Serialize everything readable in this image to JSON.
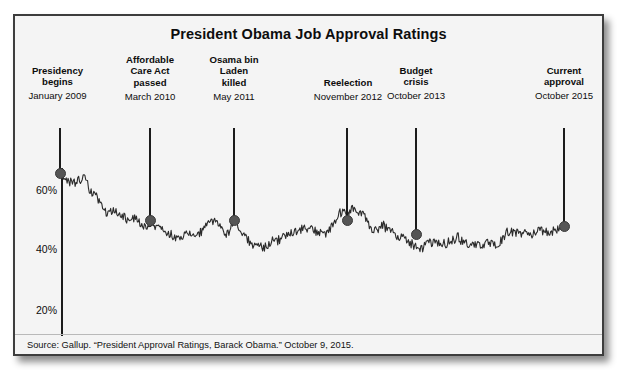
{
  "chart": {
    "title": "President Obama Job Approval Ratings",
    "source": "Source: Gallup. “President Approval Ratings, Barack Obama.” October 9, 2015.",
    "y_ticks": [
      {
        "label": "60%",
        "value": 60
      },
      {
        "label": "40%",
        "value": 40
      },
      {
        "label": "20%",
        "value": 20
      }
    ],
    "annotations": [
      {
        "label": "Presidency\nbegins",
        "date": "January 2009",
        "value": 67
      },
      {
        "label": "Affordable\nCare Act\npassed",
        "date": "March 2010",
        "value": 47
      },
      {
        "label": "Osama bin\nLaden\nkilled",
        "date": "May 2011",
        "value": 47
      },
      {
        "label": "Reelection",
        "date": "November 2012",
        "value": 52
      },
      {
        "label": "Budget\ncrisis",
        "date": "October 2013",
        "value": 41
      },
      {
        "label": "Current\napproval",
        "date": "October 2015",
        "value": 48
      }
    ],
    "colors": {
      "line": "#2b2b2b",
      "marker": "#555555",
      "frame": "#3d3d3d",
      "background": "#f4f4f4"
    }
  },
  "chart_data": {
    "type": "line",
    "title": "President Obama Job Approval Ratings",
    "xlabel": "",
    "ylabel": "Approval (%)",
    "ylim": [
      15,
      72
    ],
    "xlim": [
      "January 2009",
      "October 2015"
    ],
    "grid": false,
    "legend": null,
    "series": [
      {
        "name": "Job approval rating",
        "x": [
          "2009-01",
          "2009-02",
          "2009-03",
          "2009-04",
          "2009-05",
          "2009-06",
          "2009-07",
          "2009-08",
          "2009-09",
          "2009-10",
          "2009-11",
          "2009-12",
          "2010-01",
          "2010-02",
          "2010-03",
          "2010-04",
          "2010-05",
          "2010-06",
          "2010-07",
          "2010-08",
          "2010-09",
          "2010-10",
          "2010-11",
          "2010-12",
          "2011-01",
          "2011-02",
          "2011-03",
          "2011-04",
          "2011-05",
          "2011-06",
          "2011-07",
          "2011-08",
          "2011-09",
          "2011-10",
          "2011-11",
          "2011-12",
          "2012-01",
          "2012-02",
          "2012-03",
          "2012-04",
          "2012-05",
          "2012-06",
          "2012-07",
          "2012-08",
          "2012-09",
          "2012-10",
          "2012-11",
          "2012-12",
          "2013-01",
          "2013-02",
          "2013-03",
          "2013-04",
          "2013-05",
          "2013-06",
          "2013-07",
          "2013-08",
          "2013-09",
          "2013-10",
          "2013-11",
          "2013-12",
          "2014-01",
          "2014-02",
          "2014-03",
          "2014-04",
          "2014-05",
          "2014-06",
          "2014-07",
          "2014-08",
          "2014-09",
          "2014-10",
          "2014-11",
          "2014-12",
          "2015-01",
          "2015-02",
          "2015-03",
          "2015-04",
          "2015-05",
          "2015-06",
          "2015-07",
          "2015-08",
          "2015-09",
          "2015-10"
        ],
        "values": [
          67,
          63,
          62,
          63,
          64,
          59,
          57,
          53,
          52,
          53,
          51,
          50,
          50,
          49,
          47,
          48,
          47,
          46,
          45,
          44,
          45,
          45,
          45,
          46,
          49,
          50,
          47,
          45,
          51,
          46,
          44,
          41,
          41,
          41,
          43,
          43,
          44,
          46,
          46,
          47,
          47,
          46,
          46,
          45,
          49,
          52,
          52,
          54,
          52,
          51,
          47,
          47,
          48,
          46,
          45,
          44,
          43,
          41,
          40,
          42,
          42,
          42,
          42,
          43,
          44,
          42,
          42,
          41,
          42,
          42,
          41,
          43,
          46,
          46,
          45,
          46,
          45,
          46,
          46,
          46,
          47,
          48
        ]
      }
    ],
    "annotations": [
      {
        "x": "2009-01",
        "y": 67,
        "label": "Presidency begins",
        "date": "January 2009"
      },
      {
        "x": "2010-03",
        "y": 47,
        "label": "Affordable Care Act passed",
        "date": "March 2010"
      },
      {
        "x": "2011-05",
        "y": 47,
        "label": "Osama bin Laden killed",
        "date": "May 2011"
      },
      {
        "x": "2012-11",
        "y": 52,
        "label": "Reelection",
        "date": "November 2012"
      },
      {
        "x": "2013-10",
        "y": 41,
        "label": "Budget crisis",
        "date": "October 2013"
      },
      {
        "x": "2015-10",
        "y": 48,
        "label": "Current approval",
        "date": "October 2015"
      }
    ]
  }
}
